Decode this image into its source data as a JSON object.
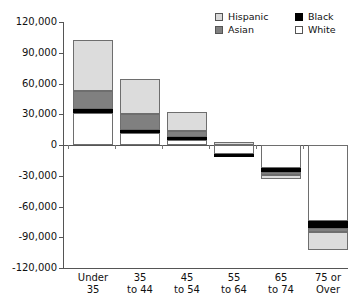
{
  "chart_data": {
    "type": "bar",
    "subtype": "stacked-diverging",
    "title": "",
    "xlabel": "",
    "ylabel": "",
    "ylim": [
      -120000,
      120000
    ],
    "ytick_step": 30000,
    "grid": false,
    "legend_position": "top-right",
    "categories": [
      "Under 35",
      "35 to 44",
      "45 to 54",
      "55 to 64",
      "65 to 74",
      "75 or Over"
    ],
    "category_lines": [
      [
        "Under",
        "35"
      ],
      [
        "35",
        "to 44"
      ],
      [
        "45",
        "to 54"
      ],
      [
        "55",
        "to 64"
      ],
      [
        "65",
        "to 74"
      ],
      [
        "75 or",
        "Over"
      ]
    ],
    "ytick_labels": [
      "120,000",
      "90,000",
      "60,000",
      "30,000",
      "0",
      "-30,000",
      "-60,000",
      "-90,000",
      "-120,000"
    ],
    "ytick_values": [
      120000,
      90000,
      60000,
      30000,
      0,
      -30000,
      -60000,
      -90000,
      -120000
    ],
    "series": [
      {
        "name": "White",
        "color": "#ffffff",
        "values": [
          31000,
          12000,
          5000,
          -9000,
          -22000,
          -74000
        ]
      },
      {
        "name": "Black",
        "color": "#000000",
        "values": [
          4500,
          3000,
          3000,
          -3000,
          -4000,
          -7000
        ]
      },
      {
        "name": "Asian",
        "color": "#808080",
        "values": [
          17500,
          15000,
          6000,
          0,
          -3000,
          -4000
        ]
      },
      {
        "name": "Hispanic",
        "color": "#dcdcdc",
        "values": [
          49000,
          34000,
          18000,
          3000,
          -4000,
          -17000
        ]
      }
    ],
    "totals": [
      102000,
      64000,
      32000,
      -9000,
      -33000,
      -102000
    ],
    "stack_order_positive": [
      "White",
      "Black",
      "Asian",
      "Hispanic"
    ],
    "segments": [
      {
        "category": "Under 35",
        "parts": [
          {
            "series": "White",
            "from": 0,
            "to": 31000
          },
          {
            "series": "Black",
            "from": 31000,
            "to": 35500
          },
          {
            "series": "Asian",
            "from": 35500,
            "to": 53000
          },
          {
            "series": "Hispanic",
            "from": 53000,
            "to": 102000
          }
        ]
      },
      {
        "category": "35 to 44",
        "parts": [
          {
            "series": "White",
            "from": 0,
            "to": 12000
          },
          {
            "series": "Black",
            "from": 12000,
            "to": 15000
          },
          {
            "series": "Asian",
            "from": 15000,
            "to": 30000
          },
          {
            "series": "Hispanic",
            "from": 30000,
            "to": 64000
          }
        ]
      },
      {
        "category": "45 to 54",
        "parts": [
          {
            "series": "White",
            "from": 0,
            "to": 5000
          },
          {
            "series": "Black",
            "from": 5000,
            "to": 8000
          },
          {
            "series": "Asian",
            "from": 8000,
            "to": 14000
          },
          {
            "series": "Hispanic",
            "from": 14000,
            "to": 32000
          }
        ]
      },
      {
        "category": "55 to 64",
        "parts": [
          {
            "series": "Hispanic",
            "from": 0,
            "to": 3000
          },
          {
            "series": "White",
            "from": 0,
            "to": -9000
          },
          {
            "series": "Black",
            "from": -9000,
            "to": -12000
          }
        ]
      },
      {
        "category": "65 to 74",
        "parts": [
          {
            "series": "White",
            "from": 0,
            "to": -22000
          },
          {
            "series": "Black",
            "from": -22000,
            "to": -26000
          },
          {
            "series": "Asian",
            "from": -26000,
            "to": -29000
          },
          {
            "series": "Hispanic",
            "from": -29000,
            "to": -33000
          }
        ]
      },
      {
        "category": "75 or Over",
        "parts": [
          {
            "series": "White",
            "from": 0,
            "to": -74000
          },
          {
            "series": "Black",
            "from": -74000,
            "to": -81000
          },
          {
            "series": "Asian",
            "from": -81000,
            "to": -85000
          },
          {
            "series": "Hispanic",
            "from": -85000,
            "to": -102000
          }
        ]
      }
    ]
  },
  "legend": {
    "items": [
      {
        "label": "Hispanic",
        "swatch": "hispanic"
      },
      {
        "label": "Asian",
        "swatch": "asian"
      },
      {
        "label": "Black",
        "swatch": "black"
      },
      {
        "label": "White",
        "swatch": "white"
      }
    ],
    "left_column": [
      "Hispanic",
      "Asian"
    ],
    "right_column": [
      "Black",
      "White"
    ]
  },
  "colors": {
    "hispanic": "#dcdcdc",
    "asian": "#808080",
    "black": "#000000",
    "white": "#ffffff",
    "axis": "#555555",
    "text": "#111111",
    "background": "#ffffff"
  }
}
